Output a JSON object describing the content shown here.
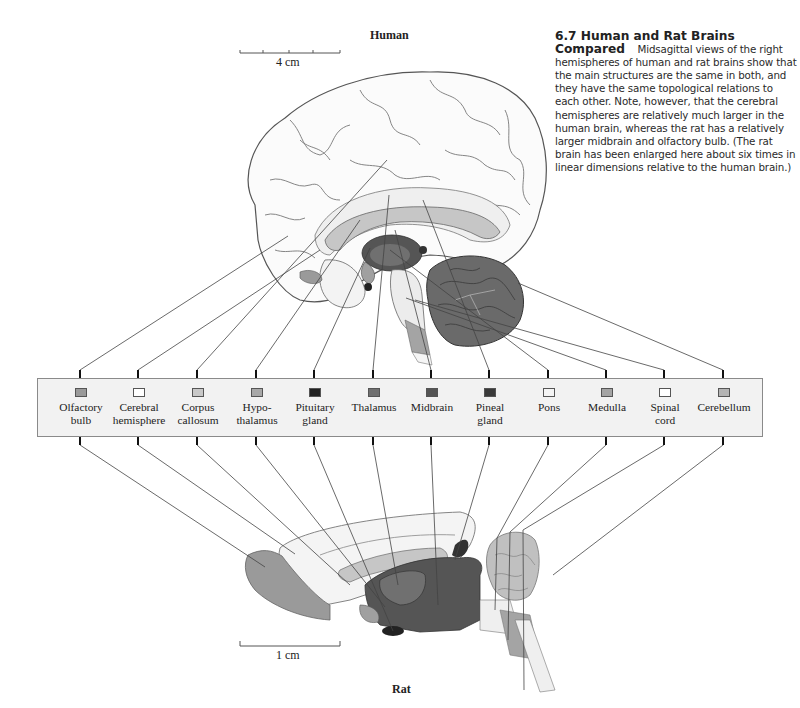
{
  "figure": {
    "number": "6.7",
    "title": "Human and Rat Brains Compared",
    "caption_title_line1": "6.7  Human and Rat Brains",
    "caption_title_line2": "Compared",
    "caption_text": "Midsagittal views of the right hemispheres of human and rat brains show that the main structures are the same in both, and they have the same topological relations to each other. Note, however, that the cerebral hemispheres are relatively much larger in the human brain, whereas the rat has a relatively larger midbrain and olfactory bulb. (The rat brain has been enlarged here about six times in linear dimensions relative to the human brain.)"
  },
  "human": {
    "label": "Human",
    "scale_bar": "4 cm"
  },
  "rat": {
    "label": "Rat",
    "scale_bar": "1 cm"
  },
  "legend": {
    "items": [
      {
        "line1": "Olfactory",
        "line2": "bulb",
        "color": "#9a9a9a"
      },
      {
        "line1": "Cerebral",
        "line2": "hemisphere",
        "color": "#ffffff"
      },
      {
        "line1": "Corpus",
        "line2": "callosum",
        "color": "#c8c8c8"
      },
      {
        "line1": "Hypo-",
        "line2": "thalamus",
        "color": "#a8a8a8"
      },
      {
        "line1": "Pituitary",
        "line2": "gland",
        "color": "#222222"
      },
      {
        "line1": "Thalamus",
        "line2": "",
        "color": "#707070"
      },
      {
        "line1": "Midbrain",
        "line2": "",
        "color": "#555555"
      },
      {
        "line1": "Pineal",
        "line2": "gland",
        "color": "#3a3a3a"
      },
      {
        "line1": "Pons",
        "line2": "",
        "color": "#f4f4f4"
      },
      {
        "line1": "Medulla",
        "line2": "",
        "color": "#a4a4a4"
      },
      {
        "line1": "Spinal",
        "line2": "cord",
        "color": "#ffffff"
      },
      {
        "line1": "Cerebellum",
        "line2": "",
        "color": "#b4b4b4"
      }
    ]
  }
}
